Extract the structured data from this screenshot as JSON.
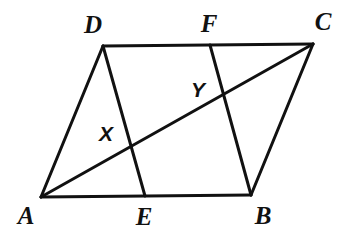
{
  "figure": {
    "kind": "geometry-diagram",
    "background_color": "#ffffff",
    "stroke_color": "#111111",
    "stroke_width": 3,
    "width": 353,
    "height": 237,
    "points": [
      {
        "id": "A",
        "label": "A",
        "x": 41,
        "y": 197,
        "label_x": 26,
        "label_y": 215,
        "style": "vertex"
      },
      {
        "id": "B",
        "label": "B",
        "x": 251,
        "y": 195,
        "label_x": 263,
        "label_y": 215,
        "style": "vertex"
      },
      {
        "id": "C",
        "label": "C",
        "x": 313,
        "y": 44,
        "label_x": 323,
        "label_y": 21,
        "style": "vertex"
      },
      {
        "id": "D",
        "label": "D",
        "x": 103,
        "y": 46,
        "label_x": 93,
        "label_y": 24,
        "style": "vertex"
      },
      {
        "id": "E",
        "label": "E",
        "x": 145,
        "y": 196,
        "label_x": 144,
        "label_y": 216,
        "style": "vertex"
      },
      {
        "id": "F",
        "label": "F",
        "x": 210,
        "y": 45,
        "label_x": 209,
        "label_y": 23,
        "style": "vertex"
      },
      {
        "id": "X",
        "label": "X",
        "x": 131,
        "y": 144,
        "label_x": 106,
        "label_y": 133,
        "style": "intersection"
      },
      {
        "id": "Y",
        "label": "Y",
        "x": 223,
        "y": 97,
        "label_x": 198,
        "label_y": 89,
        "style": "intersection"
      }
    ],
    "segments": [
      {
        "id": "AD",
        "from": "A",
        "to": "D",
        "name": "side-AD"
      },
      {
        "id": "DC",
        "from": "D",
        "to": "C",
        "name": "side-DC"
      },
      {
        "id": "CB",
        "from": "C",
        "to": "B",
        "name": "side-CB"
      },
      {
        "id": "AB",
        "from": "A",
        "to": "B",
        "name": "side-AB"
      },
      {
        "id": "DE",
        "from": "D",
        "to": "E",
        "name": "segment-DE"
      },
      {
        "id": "FB",
        "from": "F",
        "to": "B",
        "name": "segment-FB"
      },
      {
        "id": "AC",
        "from": "A",
        "to": "C",
        "name": "diagonal-AC"
      }
    ]
  }
}
